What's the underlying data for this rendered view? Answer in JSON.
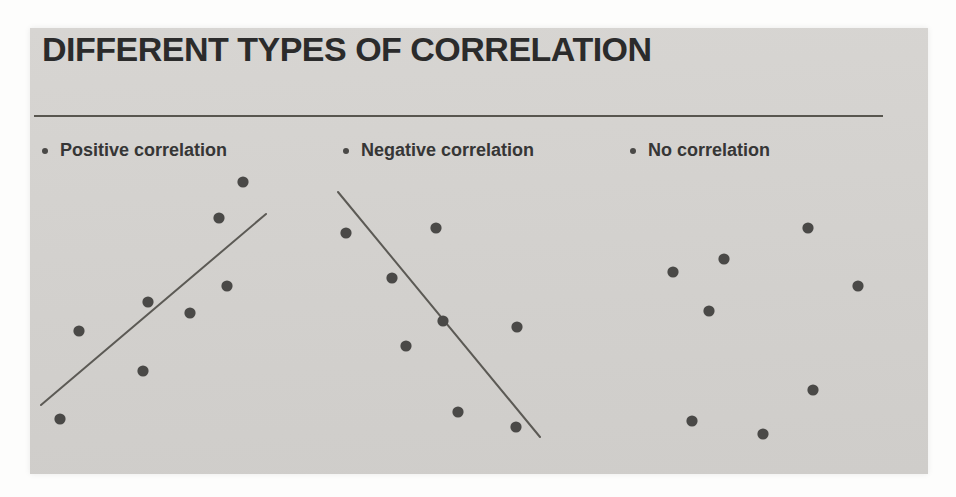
{
  "slide": {
    "title": "DIFFERENT TYPES OF CORRELATION",
    "panels": [
      {
        "label": "Positive correlation"
      },
      {
        "label": "Negative correlation"
      },
      {
        "label": "No correlation"
      }
    ]
  },
  "colors": {
    "page_background": "#fdfdfc",
    "slide_background": "#d2d0cd",
    "slide_background_light": "#d7d5d2",
    "slide_background_dark": "#cfcdca",
    "title_text": "#2b2b2b",
    "label_text": "#363636",
    "dot": "#4a4947",
    "trend_line": "#5c5a55",
    "rule": "#58564f"
  },
  "chart_data": [
    {
      "type": "scatter",
      "title": "Positive correlation",
      "axes_shown": false,
      "note": "pixel coordinates within slide, y increases downward",
      "points_px": [
        [
          213,
          154
        ],
        [
          189,
          190
        ],
        [
          197,
          258
        ],
        [
          118,
          274
        ],
        [
          160,
          285
        ],
        [
          49,
          303
        ],
        [
          113,
          343
        ],
        [
          30,
          391
        ]
      ],
      "trend_line_px": [
        [
          11,
          377
        ],
        [
          236,
          186
        ]
      ],
      "trend_direction": "upward"
    },
    {
      "type": "scatter",
      "title": "Negative correlation",
      "axes_shown": false,
      "note": "pixel coordinates within slide, y increases downward",
      "points_px": [
        [
          316,
          205
        ],
        [
          406,
          200
        ],
        [
          362,
          250
        ],
        [
          413,
          293
        ],
        [
          487,
          299
        ],
        [
          376,
          318
        ],
        [
          428,
          384
        ],
        [
          486,
          399
        ]
      ],
      "trend_line_px": [
        [
          308,
          164
        ],
        [
          510,
          409
        ]
      ],
      "trend_direction": "downward"
    },
    {
      "type": "scatter",
      "title": "No correlation",
      "axes_shown": false,
      "note": "pixel coordinates within slide, y increases downward",
      "points_px": [
        [
          778,
          200
        ],
        [
          694,
          231
        ],
        [
          643,
          244
        ],
        [
          828,
          258
        ],
        [
          679,
          283
        ],
        [
          783,
          362
        ],
        [
          662,
          393
        ],
        [
          733,
          406
        ]
      ],
      "trend_line_px": null,
      "trend_direction": "none"
    }
  ],
  "style_hints": {
    "dot_radius_px": 5.6,
    "trend_line_width_px": 2
  }
}
